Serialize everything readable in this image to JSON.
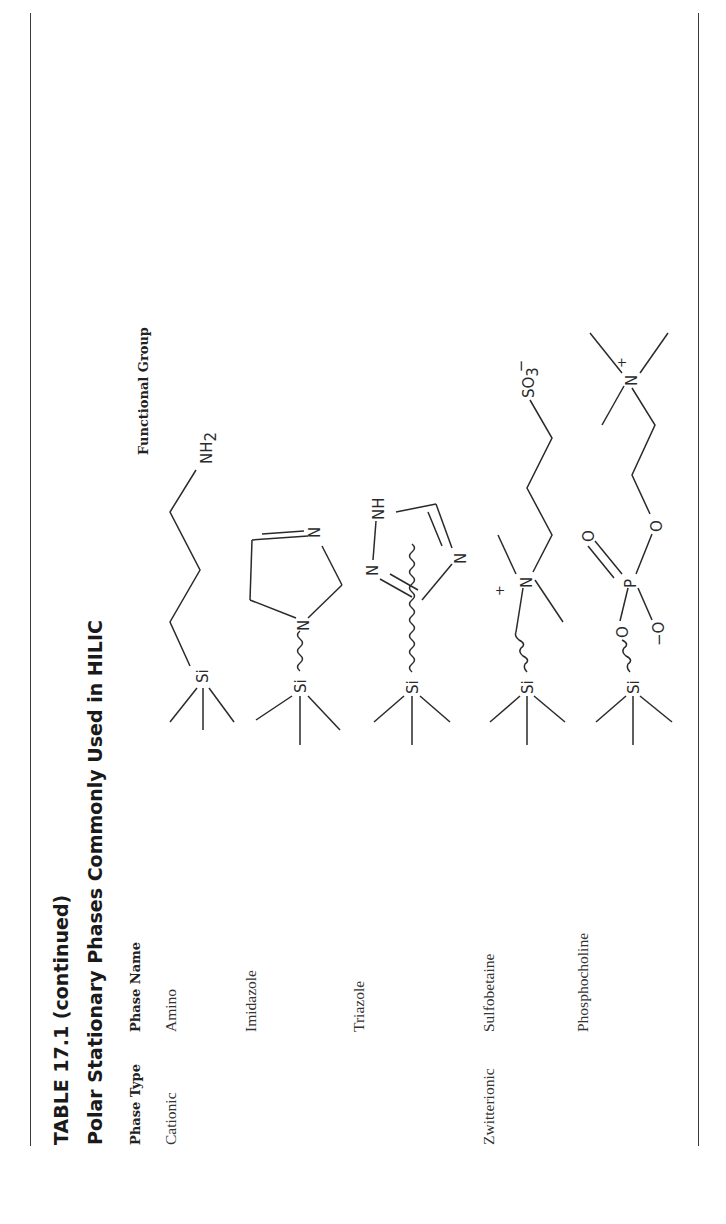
{
  "table": {
    "number_label": "TABLE 17.1 (continued)",
    "caption": "Polar Stationary Phases Commonly Used in HILIC",
    "columns": [
      "Phase Type",
      "Phase Name",
      "Functional Group"
    ],
    "rows": [
      {
        "phase_type": "Cationic",
        "phase_name": "Amino",
        "functional_group": "Si–(CH2)3–NH2 (aminopropyl)"
      },
      {
        "phase_type": "",
        "phase_name": "Imidazole",
        "functional_group": "Si~N-imidazoline ring"
      },
      {
        "phase_type": "",
        "phase_name": "Triazole",
        "functional_group": "Si~1,2,4-triazole ring"
      },
      {
        "phase_type": "Zwitterionic",
        "phase_name": "Sulfobetaine",
        "functional_group": "Si~N+(CH3)2–(CH2)3–SO3−"
      },
      {
        "phase_type": "",
        "phase_name": "Phosphocholine",
        "functional_group": "Si~O–P(=O)(O−)–O–(CH2)2–N+(CH3)3"
      }
    ]
  },
  "atom_labels": {
    "si": "Si",
    "n": "N",
    "nh": "NH",
    "nh2_main": "NH",
    "nh2_sub": "2",
    "so3_main": "SO",
    "so3_sub": "3",
    "minus": "−",
    "plus": "+",
    "p": "P",
    "o": "O",
    "o_minus": "−O"
  }
}
